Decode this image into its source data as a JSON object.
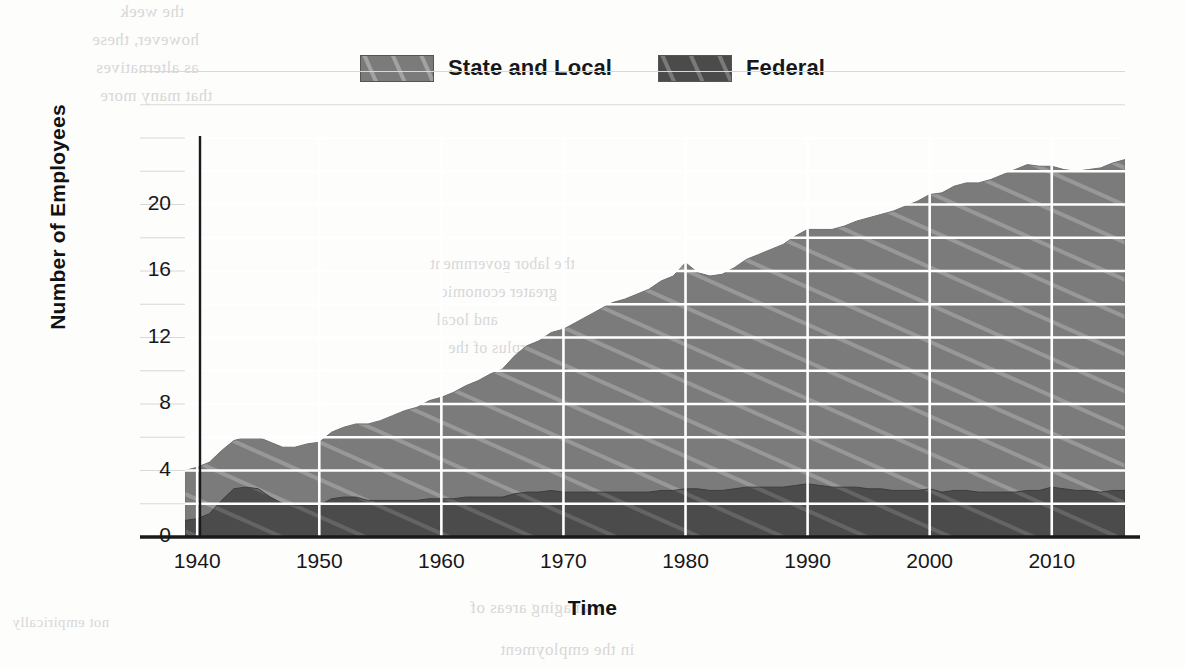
{
  "legend": {
    "position": "top-center",
    "entries": [
      {
        "label": "State and Local",
        "color": "#7b7b7b",
        "pattern": "diagonal-hatch"
      },
      {
        "label": "Federal",
        "color": "#4b4b4b",
        "pattern": "diagonal-hatch"
      }
    ]
  },
  "axes": {
    "x_title": "Time",
    "y_title": "Number of Employees",
    "x_ticks": [
      "1940",
      "1950",
      "1960",
      "1970",
      "1980",
      "1990",
      "2000",
      "2010"
    ],
    "y_ticks": [
      "0",
      "4",
      "8",
      "12",
      "16",
      "20"
    ]
  },
  "paper": {
    "bleed_lines": [
      "the week",
      "however, these",
      "as alternatives",
      "that many more",
      "the labor government",
      "greater economic",
      "and local",
      "the surplus of the",
      "managing areas of",
      "in the employment",
      "not empirically"
    ]
  },
  "chart_data": {
    "type": "area",
    "stacked": true,
    "title": "",
    "xlabel": "Time",
    "ylabel": "Number of Employees",
    "xlim": [
      1939,
      2016
    ],
    "ylim": [
      0,
      24
    ],
    "ytick_step": 4,
    "minor_gridline_step": 2,
    "xtick_step": 10,
    "grid": true,
    "legend_position": "top-center",
    "x": [
      1939,
      1940,
      1941,
      1942,
      1943,
      1944,
      1945,
      1946,
      1947,
      1948,
      1949,
      1950,
      1951,
      1952,
      1953,
      1954,
      1955,
      1956,
      1957,
      1958,
      1959,
      1960,
      1961,
      1962,
      1963,
      1964,
      1965,
      1966,
      1967,
      1968,
      1969,
      1970,
      1971,
      1972,
      1973,
      1974,
      1975,
      1976,
      1977,
      1978,
      1979,
      1980,
      1981,
      1982,
      1983,
      1984,
      1985,
      1986,
      1987,
      1988,
      1989,
      1990,
      1991,
      1992,
      1993,
      1994,
      1995,
      1996,
      1997,
      1998,
      1999,
      2000,
      2001,
      2002,
      2003,
      2004,
      2005,
      2006,
      2007,
      2008,
      2009,
      2010,
      2011,
      2012,
      2013,
      2014,
      2015,
      2016
    ],
    "series": [
      {
        "name": "Federal",
        "color": "#4b4b4b",
        "pattern": "diagonal-hatch",
        "values": [
          1.0,
          1.1,
          1.4,
          2.2,
          2.9,
          3.0,
          2.9,
          2.4,
          2.0,
          1.9,
          1.9,
          1.9,
          2.3,
          2.4,
          2.4,
          2.2,
          2.2,
          2.2,
          2.2,
          2.2,
          2.3,
          2.3,
          2.3,
          2.4,
          2.4,
          2.4,
          2.4,
          2.6,
          2.7,
          2.7,
          2.8,
          2.7,
          2.7,
          2.7,
          2.7,
          2.7,
          2.7,
          2.7,
          2.7,
          2.8,
          2.8,
          2.9,
          2.9,
          2.8,
          2.8,
          2.9,
          3.0,
          3.0,
          3.0,
          3.0,
          3.1,
          3.2,
          3.1,
          3.0,
          3.0,
          3.0,
          2.9,
          2.9,
          2.8,
          2.8,
          2.8,
          2.9,
          2.7,
          2.8,
          2.8,
          2.7,
          2.7,
          2.7,
          2.7,
          2.8,
          2.8,
          3.0,
          2.9,
          2.8,
          2.8,
          2.7,
          2.8,
          2.8
        ]
      },
      {
        "name": "State and Local",
        "color": "#7b7b7b",
        "pattern": "diagonal-hatch",
        "values": [
          3.0,
          3.1,
          3.1,
          3.0,
          2.9,
          3.0,
          3.1,
          3.3,
          3.4,
          3.5,
          3.7,
          3.8,
          4.0,
          4.2,
          4.4,
          4.6,
          4.8,
          5.1,
          5.4,
          5.6,
          5.9,
          6.1,
          6.4,
          6.7,
          7.0,
          7.4,
          7.7,
          8.3,
          8.8,
          9.1,
          9.5,
          9.8,
          10.2,
          10.6,
          11.0,
          11.4,
          11.6,
          11.9,
          12.2,
          12.6,
          12.9,
          13.6,
          13.0,
          12.9,
          13.0,
          13.3,
          13.7,
          14.0,
          14.3,
          14.6,
          15.0,
          15.3,
          15.4,
          15.5,
          15.7,
          16.0,
          16.3,
          16.5,
          16.8,
          17.1,
          17.4,
          17.7,
          18.0,
          18.3,
          18.5,
          18.6,
          18.8,
          19.1,
          19.4,
          19.6,
          19.5,
          19.3,
          19.2,
          19.2,
          19.3,
          19.5,
          19.7,
          19.9
        ]
      }
    ],
    "total_values": [
      4.0,
      4.2,
      4.5,
      5.2,
      5.8,
      6.0,
      6.0,
      5.7,
      5.4,
      5.4,
      5.6,
      5.7,
      6.3,
      6.6,
      6.8,
      6.8,
      7.0,
      7.3,
      7.6,
      7.8,
      8.2,
      8.4,
      8.7,
      9.1,
      9.4,
      9.8,
      10.1,
      10.9,
      11.5,
      11.8,
      12.3,
      12.5,
      12.9,
      13.3,
      13.7,
      14.1,
      14.3,
      14.6,
      14.9,
      15.4,
      15.7,
      16.5,
      15.9,
      15.7,
      15.8,
      16.2,
      16.7,
      17.0,
      17.3,
      17.6,
      18.1,
      18.5,
      18.5,
      18.5,
      18.7,
      19.0,
      19.2,
      19.4,
      19.6,
      19.9,
      20.2,
      20.6,
      20.7,
      21.1,
      21.3,
      21.3,
      21.5,
      21.8,
      22.1,
      22.4,
      22.3,
      22.3,
      22.1,
      22.0,
      22.1,
      22.2,
      22.5,
      22.7
    ]
  }
}
